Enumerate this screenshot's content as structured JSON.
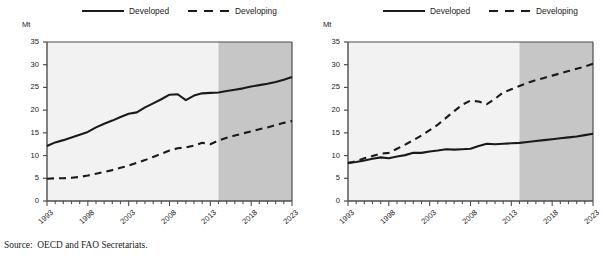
{
  "source_note": "Source:  OECD and FAO Secretariats.",
  "legend": {
    "developed_label": "Developed",
    "developing_label": "Developing"
  },
  "axis": {
    "unit": "Mt",
    "y_ticks": [
      "0",
      "5",
      "10",
      "15",
      "20",
      "25",
      "30",
      "35"
    ],
    "x_ticks": [
      "1993",
      "1998",
      "2003",
      "2008",
      "2013",
      "2018",
      "2023"
    ]
  },
  "colors": {
    "line": "#1a1a1a",
    "plot_background": "#f2f2f2",
    "projection_shade": "#c6c6c6",
    "axis": "#4d4d4d"
  },
  "chart_data": [
    {
      "type": "line",
      "title": "",
      "xlabel": "",
      "ylabel": "Mt",
      "ylim": [
        0,
        35
      ],
      "xlim": [
        1993,
        2023
      ],
      "grid": false,
      "legend_position": "top",
      "projection_start": 2014,
      "x": [
        1993,
        1994,
        1995,
        1996,
        1997,
        1998,
        1999,
        2000,
        2001,
        2002,
        2003,
        2004,
        2005,
        2006,
        2007,
        2008,
        2009,
        2010,
        2011,
        2012,
        2013,
        2014,
        2015,
        2016,
        2017,
        2018,
        2019,
        2020,
        2021,
        2022,
        2023
      ],
      "series": [
        {
          "name": "Developed",
          "style": "solid",
          "values": [
            12.1,
            12.9,
            13.4,
            14.0,
            14.6,
            15.2,
            16.2,
            17.0,
            17.7,
            18.5,
            19.2,
            19.5,
            20.6,
            21.5,
            22.4,
            23.4,
            23.5,
            22.2,
            23.2,
            23.7,
            23.8,
            23.9,
            24.2,
            24.5,
            24.8,
            25.2,
            25.5,
            25.8,
            26.2,
            26.7,
            27.3
          ]
        },
        {
          "name": "Developing",
          "style": "dashed",
          "values": [
            4.9,
            5.0,
            5.0,
            5.1,
            5.3,
            5.6,
            6.0,
            6.4,
            6.8,
            7.3,
            7.8,
            8.4,
            9.0,
            9.7,
            10.4,
            11.1,
            11.6,
            11.8,
            12.2,
            12.8,
            12.5,
            13.3,
            13.9,
            14.4,
            14.9,
            15.3,
            15.8,
            16.2,
            16.7,
            17.2,
            17.6
          ]
        }
      ]
    },
    {
      "type": "line",
      "title": "",
      "xlabel": "",
      "ylabel": "Mt",
      "ylim": [
        0,
        35
      ],
      "xlim": [
        1993,
        2023
      ],
      "grid": false,
      "legend_position": "top",
      "projection_start": 2014,
      "x": [
        1993,
        1994,
        1995,
        1996,
        1997,
        1998,
        1999,
        2000,
        2001,
        2002,
        2003,
        2004,
        2005,
        2006,
        2007,
        2008,
        2009,
        2010,
        2011,
        2012,
        2013,
        2014,
        2015,
        2016,
        2017,
        2018,
        2019,
        2020,
        2021,
        2022,
        2023
      ],
      "series": [
        {
          "name": "Developed",
          "style": "solid",
          "values": [
            8.4,
            8.6,
            8.9,
            9.3,
            9.6,
            9.4,
            9.8,
            10.1,
            10.6,
            10.6,
            10.9,
            11.1,
            11.4,
            11.3,
            11.4,
            11.5,
            12.1,
            12.6,
            12.5,
            12.6,
            12.7,
            12.8,
            13.0,
            13.2,
            13.4,
            13.6,
            13.8,
            14.0,
            14.2,
            14.5,
            14.8
          ]
        },
        {
          "name": "Developing",
          "style": "dashed",
          "values": [
            8.3,
            8.8,
            9.4,
            9.9,
            10.4,
            10.6,
            11.5,
            12.4,
            13.4,
            14.4,
            15.6,
            16.8,
            18.3,
            19.8,
            21.2,
            22.1,
            21.9,
            21.3,
            22.5,
            23.9,
            24.6,
            25.3,
            26.0,
            26.6,
            27.1,
            27.6,
            28.1,
            28.6,
            29.1,
            29.6,
            30.2
          ]
        }
      ]
    }
  ]
}
